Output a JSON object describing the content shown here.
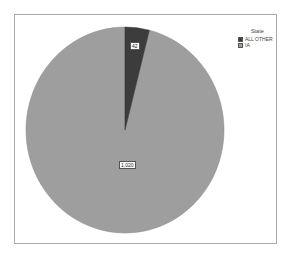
{
  "chart_data": {
    "type": "pie",
    "title": "",
    "legend_title": "State",
    "legend_position": "top-right",
    "categories": [
      "ALL OTHER",
      "IA"
    ],
    "values": [
      42,
      1020
    ],
    "value_labels": [
      "42",
      "1,020"
    ],
    "colors": [
      "#3c3c3c",
      "#9e9e9e"
    ],
    "start_angle_deg": 0,
    "direction": "clockwise"
  },
  "legend": {
    "title": "State",
    "items": [
      {
        "label": "ALL OTHER",
        "color": "#3c3c3c"
      },
      {
        "label": "IA",
        "color": "#9e9e9e"
      }
    ]
  },
  "labels": {
    "slice_0": "42",
    "slice_1": "1,020"
  }
}
